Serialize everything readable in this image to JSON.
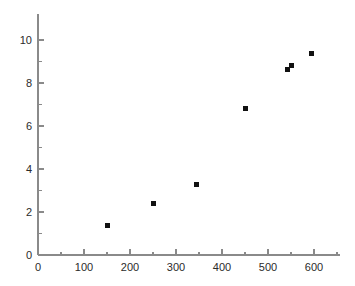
{
  "chart_data": {
    "type": "scatter",
    "title": "",
    "subtitle": "",
    "xlabel": "",
    "ylabel": "",
    "xlim": [
      0,
      650
    ],
    "ylim": [
      0,
      10.7
    ],
    "grid": false,
    "legend": null,
    "legend_position": "none",
    "x_ticks": [
      0,
      100,
      200,
      300,
      400,
      500,
      600
    ],
    "x_tick_labels": [
      "0",
      "100",
      "200",
      "300",
      "400",
      "500",
      "600"
    ],
    "x_minor_ticks": [
      50,
      150,
      250,
      350,
      450,
      550,
      650
    ],
    "y_ticks": [
      0,
      2,
      4,
      6,
      8,
      10
    ],
    "y_tick_labels": [
      "0",
      "2",
      "4",
      "6",
      "8",
      "10"
    ],
    "y_minor_ticks": [
      1,
      3,
      5,
      7,
      9
    ],
    "series": [
      {
        "name": "",
        "marker": "square",
        "color": "#111111",
        "marker_size": 5,
        "points": [
          {
            "x": 150,
            "y": 1.35
          },
          {
            "x": 250,
            "y": 2.4
          },
          {
            "x": 345,
            "y": 3.3
          },
          {
            "x": 450,
            "y": 6.8
          },
          {
            "x": 543,
            "y": 8.65
          },
          {
            "x": 550,
            "y": 8.8
          },
          {
            "x": 595,
            "y": 9.35
          }
        ]
      }
    ]
  },
  "style": {
    "background": "#ffffff",
    "axis_color": "#8a8a8a",
    "tick_label_color": "#2b2b2b",
    "marker_color": "#111111"
  }
}
